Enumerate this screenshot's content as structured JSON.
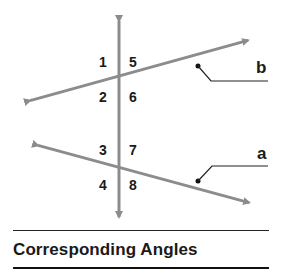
{
  "title": "Corresponding Angles",
  "colors": {
    "line": "#8c8c8c",
    "text": "#1a1a1a",
    "rule": "#222222"
  },
  "lines": {
    "b": {
      "label": "b",
      "from": [
        25,
        102
      ],
      "to": [
        253,
        39
      ]
    },
    "a": {
      "label": "a",
      "from": [
        33,
        144
      ],
      "to": [
        254,
        204
      ]
    },
    "transversal": {
      "from": [
        119,
        15
      ],
      "to": [
        119,
        223
      ]
    }
  },
  "angles": {
    "n1": "1",
    "n2": "2",
    "n3": "3",
    "n4": "4",
    "n5": "5",
    "n6": "6",
    "n7": "7",
    "n8": "8"
  }
}
